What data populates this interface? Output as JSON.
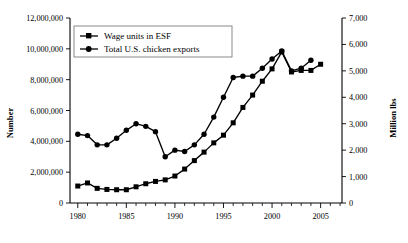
{
  "chart_data": {
    "type": "line",
    "title": "",
    "xlabel": "",
    "ylabel": "Number",
    "y2label": "Million lbs",
    "xlim": [
      1979.2,
      2007.2
    ],
    "ylim": [
      0,
      12000000
    ],
    "y2lim": [
      0,
      7000
    ],
    "grid": false,
    "legend_position": "top-left-inside",
    "x_ticks_major": [
      1980,
      1985,
      1990,
      1995,
      2000,
      2005
    ],
    "x_tick_labels": [
      "1980",
      "1985",
      "1990",
      "1995",
      "2000",
      "2005"
    ],
    "x_ticks_minor_step": 1,
    "y_ticks": [
      0,
      2000000,
      4000000,
      6000000,
      8000000,
      10000000,
      12000000
    ],
    "y_tick_labels": [
      "0",
      "2,000,000",
      "4,000,000",
      "6,000,000",
      "8,000,000",
      "10,000,000",
      "12,000,000"
    ],
    "y2_ticks": [
      0,
      1000,
      2000,
      3000,
      4000,
      5000,
      6000,
      7000
    ],
    "y2_tick_labels": [
      "0",
      "1,000",
      "2,000",
      "3,000",
      "4,000",
      "5,000",
      "6,000",
      "7,000"
    ],
    "series": [
      {
        "name": "Wage units in ESF",
        "axis": "left",
        "marker": "square",
        "x": [
          1980,
          1981,
          1982,
          1983,
          1984,
          1985,
          1986,
          1987,
          1988,
          1989,
          1990,
          1991,
          1992,
          1993,
          1994,
          1995,
          1996,
          1997,
          1998,
          1999,
          2000,
          2001,
          2002,
          2003,
          2004,
          2005
        ],
        "values": [
          1100000,
          1300000,
          950000,
          880000,
          860000,
          860000,
          1050000,
          1250000,
          1400000,
          1500000,
          1750000,
          2200000,
          2750000,
          3300000,
          3900000,
          4400000,
          5200000,
          6200000,
          7000000,
          7900000,
          8700000,
          9800000,
          8500000,
          8600000,
          8600000,
          9000000
        ]
      },
      {
        "name": "Total U.S. chicken exports",
        "axis": "right",
        "marker": "circle",
        "x": [
          1980,
          1981,
          1982,
          1983,
          1984,
          1985,
          1986,
          1987,
          1988,
          1989,
          1990,
          1991,
          1992,
          1993,
          1994,
          1995,
          1996,
          1997,
          1998,
          1999,
          2000,
          2001,
          2002,
          2003,
          2004
        ],
        "values": [
          2600,
          2550,
          2200,
          2200,
          2450,
          2750,
          3000,
          2900,
          2700,
          1750,
          2000,
          1950,
          2200,
          2600,
          3250,
          4000,
          4750,
          4800,
          4800,
          5100,
          5450,
          5750,
          5000,
          5100,
          5400
        ]
      }
    ]
  },
  "legend": {
    "entries": [
      {
        "label": "Wage units in ESF"
      },
      {
        "label": "Total U.S. chicken exports"
      }
    ]
  },
  "axes": {
    "left_title": "Number",
    "right_title": "Million lbs"
  }
}
